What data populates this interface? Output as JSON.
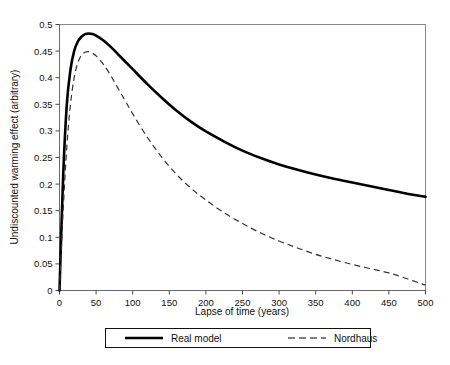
{
  "chart_data": {
    "type": "line",
    "title": "",
    "xlabel": "Lapse of time (years)",
    "ylabel": "Undiscounted warming effect (arbitrary)",
    "xlim": [
      0,
      500
    ],
    "ylim": [
      0,
      0.5
    ],
    "xticks": [
      0,
      50,
      100,
      150,
      200,
      250,
      300,
      350,
      400,
      450,
      500
    ],
    "xtick_labels": [
      "0",
      "50",
      "100",
      "150",
      "200",
      "250",
      "300",
      "350",
      "400",
      "450",
      "500"
    ],
    "yticks": [
      0,
      0.05,
      0.1,
      0.15,
      0.2,
      0.25,
      0.3,
      0.35,
      0.4,
      0.45,
      0.5
    ],
    "ytick_labels": [
      "0",
      "0.05",
      "0.1",
      "0.15",
      "0.2",
      "0.25",
      "0.3",
      "0.35",
      "0.4",
      "0.45",
      "0.5"
    ],
    "grid": false,
    "legend_position": "bottom",
    "x": [
      0,
      5,
      10,
      15,
      20,
      25,
      30,
      35,
      40,
      45,
      50,
      60,
      70,
      80,
      90,
      100,
      120,
      140,
      160,
      180,
      200,
      225,
      250,
      275,
      300,
      325,
      350,
      375,
      400,
      425,
      450,
      475,
      500
    ],
    "series": [
      {
        "name": "Real model",
        "style": "solid",
        "color": "#000000",
        "values": [
          0.0,
          0.215,
          0.35,
          0.415,
          0.45,
          0.468,
          0.477,
          0.482,
          0.483,
          0.482,
          0.479,
          0.47,
          0.458,
          0.444,
          0.43,
          0.416,
          0.388,
          0.362,
          0.338,
          0.317,
          0.299,
          0.28,
          0.263,
          0.249,
          0.237,
          0.227,
          0.218,
          0.21,
          0.203,
          0.196,
          0.189,
          0.182,
          0.176
        ]
      },
      {
        "name": "Nordhaus",
        "style": "dashed",
        "color": "#333333",
        "values": [
          0.0,
          0.15,
          0.27,
          0.35,
          0.4,
          0.428,
          0.442,
          0.448,
          0.449,
          0.446,
          0.441,
          0.425,
          0.404,
          0.38,
          0.356,
          0.332,
          0.288,
          0.25,
          0.218,
          0.192,
          0.17,
          0.146,
          0.126,
          0.108,
          0.093,
          0.08,
          0.068,
          0.058,
          0.049,
          0.041,
          0.033,
          0.022,
          0.01
        ]
      }
    ],
    "legend_entries": [
      {
        "label": "Real model",
        "style": "solid"
      },
      {
        "label": "Nordhaus",
        "style": "dashed"
      }
    ]
  }
}
